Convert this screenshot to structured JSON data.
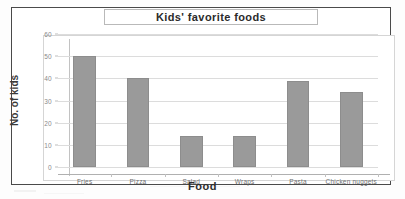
{
  "chart_data": {
    "type": "bar",
    "title": "Kids' favorite foods",
    "xlabel": "Food",
    "ylabel": "No. of kids",
    "categories": [
      "Fries",
      "Pizza",
      "Salad",
      "Wraps",
      "Pasta",
      "Chicken nuggets"
    ],
    "values": [
      50,
      40,
      14,
      14,
      39,
      34
    ],
    "ylim": [
      0,
      60
    ],
    "yticks": [
      0,
      10,
      20,
      30,
      40,
      50,
      60
    ],
    "ytick_labels": [
      "0",
      "10",
      "20",
      "30",
      "40",
      "50",
      "60"
    ],
    "grid": true,
    "legend": "none",
    "series": [
      {
        "name": "No. of kids",
        "values": [
          50,
          40,
          14,
          14,
          39,
          34
        ]
      }
    ],
    "bar_color": "#9a9a9a",
    "gridline_color": "#dcdcdc",
    "frame_color": "#4a4a4a"
  }
}
